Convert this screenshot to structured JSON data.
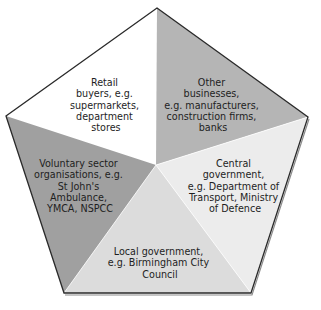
{
  "diagram": {
    "type": "pentagon-segments",
    "title": "",
    "segments": [
      {
        "id": "retail",
        "lines": [
          "Retail",
          "buyers, e.g.",
          "supermarkets,",
          "department",
          "stores"
        ],
        "fill": "#ffffff"
      },
      {
        "id": "other-businesses",
        "lines": [
          "Other",
          "businesses,",
          "e.g. manufacturers,",
          "construction firms,",
          "banks"
        ],
        "fill": "#b5b5b5"
      },
      {
        "id": "central-government",
        "lines": [
          "Central",
          "government,",
          "e.g. Department of",
          "Transport, Ministry",
          "of Defence"
        ],
        "fill": "#ececec"
      },
      {
        "id": "local-government",
        "lines": [
          "Local government,",
          "e.g. Birmingham City",
          "Council"
        ],
        "fill": "#dcdcdc"
      },
      {
        "id": "voluntary-sector",
        "lines": [
          "Voluntary sector",
          "organisations, e.g.",
          "St John's",
          "Ambulance,",
          "YMCA, NSPCC"
        ],
        "fill": "#a0a0a0"
      }
    ]
  }
}
